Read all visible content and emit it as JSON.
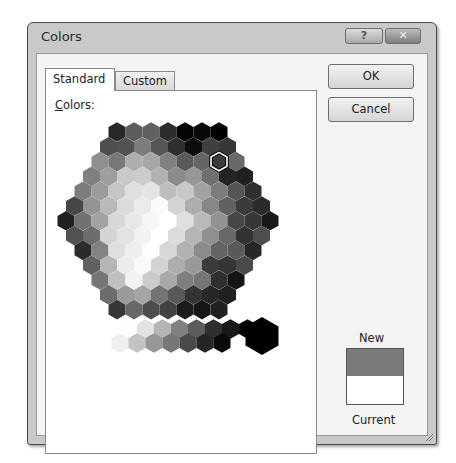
{
  "dialog": {
    "title": "Colors",
    "help_button": "?",
    "close_button": "✕"
  },
  "tabs": [
    {
      "label": "Standard",
      "active": true
    },
    {
      "label": "Custom",
      "active": false
    }
  ],
  "panel": {
    "colors_label_accel": "C",
    "colors_label_rest": "olors:"
  },
  "buttons": {
    "ok": "OK",
    "cancel": "Cancel"
  },
  "preview": {
    "new_label": "New",
    "current_label": "Current",
    "new_color": "#7a7a7a",
    "current_color": "#ffffff"
  },
  "palette": {
    "rows": [
      [
        "#003366",
        "#336699",
        "#3366CC",
        "#003399",
        "#000099",
        "#0000CC",
        "#000066"
      ],
      [
        "#006666",
        "#006699",
        "#0099CC",
        "#0066CC",
        "#0033CC",
        "#0000FF",
        "#3333FF",
        "#333399"
      ],
      [
        "#669999",
        "#009999",
        "#33CCCC",
        "#00CCFF",
        "#0099FF",
        "#0066FF",
        "#3366FF",
        "#3333CC",
        "#666699"
      ],
      [
        "#339966",
        "#00CC99",
        "#00FFCC",
        "#00FFFF",
        "#33CCFF",
        "#3399FF",
        "#6699FF",
        "#6666FF",
        "#6600FF",
        "#6600CC"
      ],
      [
        "#339933",
        "#00CC66",
        "#00FF99",
        "#66FFCC",
        "#66FFFF",
        "#66CCFF",
        "#99CCFF",
        "#9999FF",
        "#9966FF",
        "#9933FF",
        "#9900FF"
      ],
      [
        "#006600",
        "#00CC00",
        "#00FF00",
        "#66FF99",
        "#99FFCC",
        "#CCFFFF",
        "#CCCCFF",
        "#CC99FF",
        "#CC66FF",
        "#CC33FF",
        "#CC00FF",
        "#9900CC"
      ],
      [
        "#003300",
        "#009933",
        "#33CC33",
        "#66FF66",
        "#99FF99",
        "#CCFFCC",
        "#FFFFFF",
        "#FFCCFF",
        "#FF99FF",
        "#FF66FF",
        "#FF00FF",
        "#CC00CC",
        "#660066"
      ],
      [
        "#336600",
        "#009900",
        "#66FF33",
        "#99FF66",
        "#CCFF99",
        "#FFFFCC",
        "#FFCCCC",
        "#FF99CC",
        "#FF66CC",
        "#FF33CC",
        "#CC0099",
        "#993399"
      ],
      [
        "#333300",
        "#669900",
        "#99FF33",
        "#CCFF66",
        "#FFFF99",
        "#FFCC99",
        "#FF9999",
        "#FF6699",
        "#FF3399",
        "#CC3399",
        "#990099"
      ],
      [
        "#666633",
        "#99CC00",
        "#CCFF33",
        "#FFFF66",
        "#FFCC66",
        "#FF9966",
        "#FF7C80",
        "#FF0066",
        "#D60093",
        "#993366"
      ],
      [
        "#808000",
        "#CCCC00",
        "#FFFF00",
        "#FFCC00",
        "#FF9933",
        "#FF6600",
        "#FF5050",
        "#CC0066",
        "#660033"
      ],
      [
        "#996633",
        "#CC9900",
        "#FF9900",
        "#CC6600",
        "#FF3300",
        "#FF0000",
        "#CC0000",
        "#990033"
      ],
      [
        "#663300",
        "#996600",
        "#CC3300",
        "#993300",
        "#990000",
        "#800000",
        "#A50021"
      ]
    ],
    "selected": {
      "row": 2,
      "col": 7
    },
    "grays_top": [
      "#F8F8F8",
      "#DDDDDD",
      "#B2B2B2",
      "#808080",
      "#5F5F5F",
      "#333333",
      "#1C1C1C",
      "#080808"
    ],
    "grays_bottom": [
      "#EAEAEA",
      "#C0C0C0",
      "#969696",
      "#777777",
      "#4D4D4D",
      "#292929",
      "#111111"
    ],
    "black": "#000000"
  }
}
